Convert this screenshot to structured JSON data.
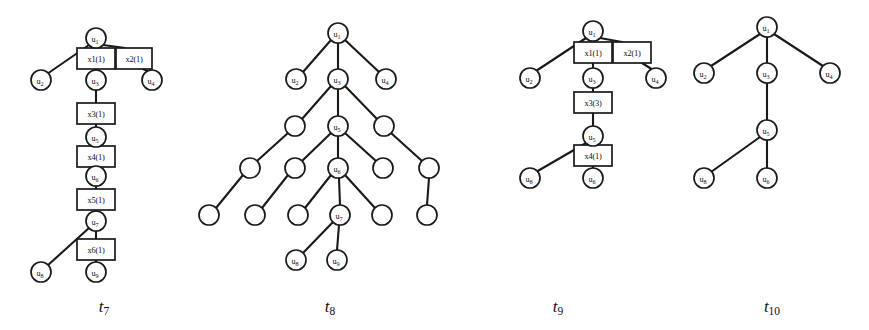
{
  "figure": {
    "background_color": "#ffffff",
    "stroke_color": "#1a1a1a",
    "node_fill": "#ffffff"
  },
  "captions": [
    {
      "id": "caption-t7",
      "base": "t",
      "sub": "7",
      "text": "t7",
      "x": 104,
      "y": 306
    },
    {
      "id": "caption-t8",
      "base": "t",
      "sub": "8",
      "text": "t8",
      "x": 330,
      "y": 306
    },
    {
      "id": "caption-t9",
      "base": "t",
      "sub": "9",
      "text": "t9",
      "x": 558,
      "y": 306
    },
    {
      "id": "caption-t10",
      "base": "t",
      "sub": "10",
      "text": "t10",
      "x": 772,
      "y": 306
    }
  ],
  "trees": [
    {
      "name": "t7",
      "caption": "t7",
      "circles": [
        {
          "name": "u1",
          "base": "u",
          "sub": "1",
          "cx": 96,
          "cy": 38,
          "r": 10
        },
        {
          "name": "u2",
          "base": "u",
          "sub": "2",
          "cx": 41,
          "cy": 80,
          "r": 10
        },
        {
          "name": "u3",
          "base": "u",
          "sub": "3",
          "cx": 96,
          "cy": 80,
          "r": 10
        },
        {
          "name": "u4",
          "base": "u",
          "sub": "4",
          "cx": 152,
          "cy": 80,
          "r": 10
        },
        {
          "name": "u5",
          "base": "u",
          "sub": "5",
          "cx": 96,
          "cy": 137,
          "r": 10
        },
        {
          "name": "u6",
          "base": "u",
          "sub": "6",
          "cx": 96,
          "cy": 176,
          "r": 10
        },
        {
          "name": "u7",
          "base": "u",
          "sub": "7",
          "cx": 96,
          "cy": 221,
          "r": 10
        },
        {
          "name": "u8",
          "base": "u",
          "sub": "8",
          "cx": 41,
          "cy": 272,
          "r": 10
        },
        {
          "name": "u9",
          "base": "u",
          "sub": "9",
          "cx": 96,
          "cy": 272,
          "r": 10
        }
      ],
      "boxes": [
        {
          "name": "x1",
          "label": "x1(1)",
          "x": 77,
          "y": 48,
          "w": 38,
          "h": 21
        },
        {
          "name": "x2",
          "label": "x2(1)",
          "x": 116,
          "y": 48,
          "w": 36,
          "h": 21
        },
        {
          "name": "x3",
          "label": "x3(1)",
          "x": 77,
          "y": 103,
          "w": 38,
          "h": 21
        },
        {
          "name": "x4",
          "label": "x4(1)",
          "x": 77,
          "y": 146,
          "w": 38,
          "h": 21
        },
        {
          "name": "x5",
          "label": "x5(1)",
          "x": 77,
          "y": 189,
          "w": 38,
          "h": 21
        },
        {
          "name": "x6",
          "label": "x6(1)",
          "x": 77,
          "y": 239,
          "w": 38,
          "h": 21
        }
      ],
      "edges": [
        {
          "name": "u1-u2",
          "x1": 89,
          "y1": 45,
          "x2": 47,
          "y2": 74
        },
        {
          "name": "u1-x1",
          "x1": 96,
          "y1": 48,
          "x2": 96,
          "y2": 48
        },
        {
          "name": "u1-x2",
          "x1": 103,
          "y1": 45,
          "x2": 125,
          "y2": 48
        },
        {
          "name": "x1-u3",
          "x1": 96,
          "y1": 69,
          "x2": 96,
          "y2": 70
        },
        {
          "name": "x2-u4",
          "x1": 143,
          "y1": 69,
          "x2": 150,
          "y2": 72
        },
        {
          "name": "u3-x3",
          "x1": 96,
          "y1": 90,
          "x2": 96,
          "y2": 103
        },
        {
          "name": "x3-u5",
          "x1": 96,
          "y1": 124,
          "x2": 96,
          "y2": 127
        },
        {
          "name": "u5-x4",
          "x1": 96,
          "y1": 147,
          "x2": 96,
          "y2": 146
        },
        {
          "name": "x4-u6",
          "x1": 96,
          "y1": 167,
          "x2": 96,
          "y2": 166
        },
        {
          "name": "u6-x5",
          "x1": 96,
          "y1": 186,
          "x2": 96,
          "y2": 189
        },
        {
          "name": "x5-u7",
          "x1": 96,
          "y1": 210,
          "x2": 96,
          "y2": 211
        },
        {
          "name": "u7-u8",
          "x1": 89,
          "y1": 228,
          "x2": 47,
          "y2": 266
        },
        {
          "name": "u7-x6",
          "x1": 96,
          "y1": 231,
          "x2": 96,
          "y2": 239
        },
        {
          "name": "x6-u9",
          "x1": 96,
          "y1": 260,
          "x2": 96,
          "y2": 262
        }
      ]
    },
    {
      "name": "t8",
      "caption": "t8",
      "circles": [
        {
          "name": "u1",
          "base": "u",
          "sub": "1",
          "cx": 338,
          "cy": 33,
          "r": 10
        },
        {
          "name": "u2",
          "base": "u",
          "sub": "2",
          "cx": 296,
          "cy": 79,
          "r": 10
        },
        {
          "name": "u3",
          "base": "u",
          "sub": "3",
          "cx": 338,
          "cy": 79,
          "r": 10
        },
        {
          "name": "u4",
          "base": "u",
          "sub": "4",
          "cx": 386,
          "cy": 79,
          "r": 10
        },
        {
          "name": "n-l2-left",
          "base": "",
          "sub": "",
          "cx": 295,
          "cy": 126,
          "r": 10
        },
        {
          "name": "u5",
          "base": "u",
          "sub": "5",
          "cx": 338,
          "cy": 126,
          "r": 10
        },
        {
          "name": "n-l2-right",
          "base": "",
          "sub": "",
          "cx": 384,
          "cy": 126,
          "r": 10
        },
        {
          "name": "n-l3-a",
          "base": "",
          "sub": "",
          "cx": 250,
          "cy": 168,
          "r": 10
        },
        {
          "name": "n-l3-b",
          "base": "",
          "sub": "",
          "cx": 295,
          "cy": 168,
          "r": 10
        },
        {
          "name": "u6",
          "base": "u",
          "sub": "6",
          "cx": 338,
          "cy": 168,
          "r": 10
        },
        {
          "name": "n-l3-c",
          "base": "",
          "sub": "",
          "cx": 383,
          "cy": 168,
          "r": 10
        },
        {
          "name": "n-l3-d",
          "base": "",
          "sub": "",
          "cx": 429,
          "cy": 168,
          "r": 10
        },
        {
          "name": "n-l4-a",
          "base": "",
          "sub": "",
          "cx": 209,
          "cy": 215,
          "r": 10
        },
        {
          "name": "n-l4-b",
          "base": "",
          "sub": "",
          "cx": 255,
          "cy": 215,
          "r": 10
        },
        {
          "name": "n-l4-c",
          "base": "",
          "sub": "",
          "cx": 298,
          "cy": 215,
          "r": 10
        },
        {
          "name": "u7",
          "base": "u",
          "sub": "7",
          "cx": 340,
          "cy": 215,
          "r": 10
        },
        {
          "name": "n-l4-d",
          "base": "",
          "sub": "",
          "cx": 382,
          "cy": 215,
          "r": 10
        },
        {
          "name": "n-l4-e",
          "base": "",
          "sub": "",
          "cx": 427,
          "cy": 215,
          "r": 10
        },
        {
          "name": "u8",
          "base": "u",
          "sub": "8",
          "cx": 296,
          "cy": 260,
          "r": 10
        },
        {
          "name": "u9",
          "base": "u",
          "sub": "9",
          "cx": 337,
          "cy": 260,
          "r": 10
        }
      ],
      "boxes": [],
      "edges": [
        {
          "name": "u1-u2",
          "x1": 331,
          "y1": 40,
          "x2": 303,
          "y2": 72
        },
        {
          "name": "u1-u3",
          "x1": 338,
          "y1": 43,
          "x2": 338,
          "y2": 69
        },
        {
          "name": "u1-u4",
          "x1": 345,
          "y1": 40,
          "x2": 379,
          "y2": 72
        },
        {
          "name": "u3-a",
          "x1": 331,
          "y1": 86,
          "x2": 302,
          "y2": 119
        },
        {
          "name": "u3-u5",
          "x1": 338,
          "y1": 89,
          "x2": 338,
          "y2": 116
        },
        {
          "name": "u3-b",
          "x1": 345,
          "y1": 86,
          "x2": 377,
          "y2": 119
        },
        {
          "name": "l2l-c",
          "x1": 288,
          "y1": 133,
          "x2": 257,
          "y2": 161
        },
        {
          "name": "u5-d",
          "x1": 331,
          "y1": 133,
          "x2": 302,
          "y2": 161
        },
        {
          "name": "u5-u6",
          "x1": 338,
          "y1": 136,
          "x2": 338,
          "y2": 158
        },
        {
          "name": "u5-e",
          "x1": 345,
          "y1": 133,
          "x2": 376,
          "y2": 161
        },
        {
          "name": "l2r-f",
          "x1": 391,
          "y1": 133,
          "x2": 422,
          "y2": 161
        },
        {
          "name": "l3a-g",
          "x1": 243,
          "y1": 175,
          "x2": 216,
          "y2": 208
        },
        {
          "name": "l3b-h",
          "x1": 288,
          "y1": 175,
          "x2": 262,
          "y2": 208
        },
        {
          "name": "u6-i",
          "x1": 331,
          "y1": 175,
          "x2": 305,
          "y2": 208
        },
        {
          "name": "u6-u7",
          "x1": 339,
          "y1": 178,
          "x2": 340,
          "y2": 205
        },
        {
          "name": "u6-j",
          "x1": 345,
          "y1": 175,
          "x2": 375,
          "y2": 208
        },
        {
          "name": "l3d-k",
          "x1": 429,
          "y1": 178,
          "x2": 427,
          "y2": 205
        },
        {
          "name": "u7-u8",
          "x1": 333,
          "y1": 222,
          "x2": 302,
          "y2": 254
        },
        {
          "name": "u7-u9",
          "x1": 339,
          "y1": 225,
          "x2": 337,
          "y2": 250
        }
      ]
    },
    {
      "name": "t9",
      "caption": "t9",
      "circles": [
        {
          "name": "u1",
          "base": "u",
          "sub": "1",
          "cx": 593,
          "cy": 31,
          "r": 10
        },
        {
          "name": "u2",
          "base": "u",
          "sub": "2",
          "cx": 530,
          "cy": 78,
          "r": 10
        },
        {
          "name": "u3",
          "base": "u",
          "sub": "3",
          "cx": 593,
          "cy": 78,
          "r": 10
        },
        {
          "name": "u4",
          "base": "u",
          "sub": "4",
          "cx": 656,
          "cy": 78,
          "r": 10
        },
        {
          "name": "u5",
          "base": "u",
          "sub": "5",
          "cx": 593,
          "cy": 136,
          "r": 10
        },
        {
          "name": "u8",
          "base": "u",
          "sub": "8",
          "cx": 530,
          "cy": 178,
          "r": 10
        },
        {
          "name": "u6",
          "base": "u",
          "sub": "6",
          "cx": 593,
          "cy": 178,
          "r": 10
        }
      ],
      "boxes": [
        {
          "name": "x1",
          "label": "x1(1)",
          "x": 574,
          "y": 42,
          "w": 38,
          "h": 21
        },
        {
          "name": "x2",
          "label": "x2(1)",
          "x": 613,
          "y": 42,
          "w": 38,
          "h": 21
        },
        {
          "name": "x3",
          "label": "x3(3)",
          "x": 574,
          "y": 92,
          "w": 38,
          "h": 21
        },
        {
          "name": "x4",
          "label": "x4(1)",
          "x": 574,
          "y": 145,
          "w": 38,
          "h": 21
        }
      ],
      "edges": [
        {
          "name": "u1-u2",
          "x1": 586,
          "y1": 38,
          "x2": 536,
          "y2": 71
        },
        {
          "name": "u1-x2",
          "x1": 600,
          "y1": 38,
          "x2": 622,
          "y2": 42
        },
        {
          "name": "x1-u3",
          "x1": 593,
          "y1": 63,
          "x2": 593,
          "y2": 68
        },
        {
          "name": "x2-u4",
          "x1": 642,
          "y1": 63,
          "x2": 653,
          "y2": 70
        },
        {
          "name": "u3-x3",
          "x1": 593,
          "y1": 88,
          "x2": 593,
          "y2": 92
        },
        {
          "name": "x3-u5",
          "x1": 593,
          "y1": 113,
          "x2": 593,
          "y2": 126
        },
        {
          "name": "u5-u8",
          "x1": 586,
          "y1": 143,
          "x2": 536,
          "y2": 172
        },
        {
          "name": "u5-x4",
          "x1": 593,
          "y1": 146,
          "x2": 593,
          "y2": 145
        },
        {
          "name": "x4-u6",
          "x1": 593,
          "y1": 166,
          "x2": 593,
          "y2": 168
        }
      ]
    },
    {
      "name": "t10",
      "caption": "t10",
      "circles": [
        {
          "name": "u1",
          "base": "u",
          "sub": "1",
          "cx": 767,
          "cy": 27,
          "r": 10
        },
        {
          "name": "u2",
          "base": "u",
          "sub": "2",
          "cx": 704,
          "cy": 73,
          "r": 10
        },
        {
          "name": "u3",
          "base": "u",
          "sub": "3",
          "cx": 767,
          "cy": 73,
          "r": 10
        },
        {
          "name": "u4",
          "base": "u",
          "sub": "4",
          "cx": 830,
          "cy": 73,
          "r": 10
        },
        {
          "name": "u5",
          "base": "u",
          "sub": "5",
          "cx": 767,
          "cy": 130,
          "r": 10
        },
        {
          "name": "u8",
          "base": "u",
          "sub": "8",
          "cx": 704,
          "cy": 178,
          "r": 10
        },
        {
          "name": "u6",
          "base": "u",
          "sub": "6",
          "cx": 767,
          "cy": 178,
          "r": 10
        }
      ],
      "boxes": [],
      "edges": [
        {
          "name": "u1-u2",
          "x1": 760,
          "y1": 34,
          "x2": 711,
          "y2": 66
        },
        {
          "name": "u1-u3",
          "x1": 767,
          "y1": 37,
          "x2": 767,
          "y2": 63
        },
        {
          "name": "u1-u4",
          "x1": 774,
          "y1": 34,
          "x2": 823,
          "y2": 66
        },
        {
          "name": "u3-u5",
          "x1": 767,
          "y1": 83,
          "x2": 767,
          "y2": 120
        },
        {
          "name": "u5-u8",
          "x1": 760,
          "y1": 137,
          "x2": 711,
          "y2": 172
        },
        {
          "name": "u5-u6",
          "x1": 767,
          "y1": 140,
          "x2": 767,
          "y2": 168
        }
      ]
    }
  ]
}
